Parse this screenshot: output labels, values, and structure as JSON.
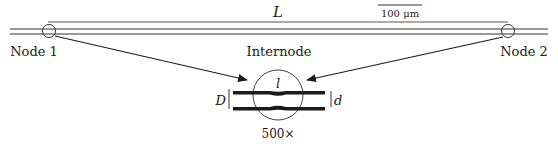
{
  "figure": {
    "length_label": "L",
    "scale_bar_label": "100 μm",
    "node_left_label": "Node 1",
    "node_right_label": "Node 2",
    "internode_label": "Internode",
    "node_gap_label": "l",
    "outer_diameter_label": "D",
    "inner_diameter_label": "d",
    "magnification_label": "500×"
  },
  "colors": {
    "stroke": "#1a1a1a",
    "fiber": "#333333",
    "background": "#ffffff"
  }
}
